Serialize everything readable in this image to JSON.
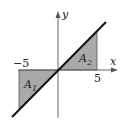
{
  "diagram": {
    "axes": {
      "x_label": "x",
      "y_label": "y"
    },
    "ticks": {
      "neg": "−5",
      "pos": "5"
    },
    "regions": [
      {
        "label": "A",
        "sub": "1",
        "vertices": [
          [
            -5,
            0
          ],
          [
            0,
            0
          ],
          [
            -5,
            -5
          ]
        ]
      },
      {
        "label": "A",
        "sub": "2",
        "vertices": [
          [
            0,
            0
          ],
          [
            5,
            0
          ],
          [
            5,
            5
          ]
        ]
      }
    ],
    "line": {
      "equation": "y = x"
    },
    "colors": {
      "fill": "#a9a9a9",
      "line": "#111111",
      "axis": "#555555"
    }
  }
}
